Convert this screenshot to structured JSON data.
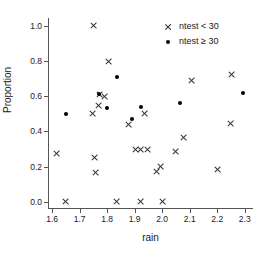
{
  "chart_data": {
    "type": "scatter",
    "title": "",
    "xlabel": "rain",
    "ylabel": "Proportion",
    "xlim": [
      1.585,
      2.33
    ],
    "ylim": [
      -0.035,
      1.045
    ],
    "grid": false,
    "xticks": [
      1.6,
      1.7,
      1.8,
      1.9,
      2.0,
      2.1,
      2.2,
      2.3
    ],
    "xticklabels": [
      "1.6",
      "1.7",
      "1.8",
      "1.9",
      "2.0",
      "2.1",
      "2.2",
      "2.3"
    ],
    "yticks": [
      0.0,
      0.2,
      0.4,
      0.6,
      0.8,
      1.0
    ],
    "yticklabels": [
      "0.0",
      "0.2",
      "0.4",
      "0.6",
      "0.8",
      "1.0"
    ],
    "legend_position": "top-right",
    "series": [
      {
        "name": "ntest < 30",
        "marker": "cross",
        "color": "#333333",
        "points": [
          [
            1.615,
            0.277
          ],
          [
            1.65,
            0.0
          ],
          [
            1.745,
            0.5
          ],
          [
            1.75,
            1.0
          ],
          [
            1.755,
            0.25
          ],
          [
            1.757,
            0.168
          ],
          [
            1.768,
            0.545
          ],
          [
            1.772,
            0.61
          ],
          [
            1.79,
            0.6
          ],
          [
            1.805,
            0.8
          ],
          [
            1.835,
            0.0
          ],
          [
            1.878,
            0.44
          ],
          [
            1.903,
            0.295
          ],
          [
            1.92,
            0.0
          ],
          [
            1.922,
            0.295
          ],
          [
            1.935,
            0.5
          ],
          [
            1.948,
            0.295
          ],
          [
            1.978,
            0.17
          ],
          [
            1.995,
            0.2
          ],
          [
            2.0,
            0.0
          ],
          [
            2.05,
            0.288
          ],
          [
            2.078,
            0.365
          ],
          [
            2.105,
            0.69
          ],
          [
            2.2,
            0.182
          ],
          [
            2.248,
            0.443
          ],
          [
            2.252,
            0.722
          ]
        ]
      },
      {
        "name": "ntest ≥ 30",
        "marker": "dot",
        "color": "#000000",
        "points": [
          [
            1.65,
            0.5
          ],
          [
            1.77,
            0.615
          ],
          [
            1.8,
            0.532
          ],
          [
            1.835,
            0.708
          ],
          [
            1.89,
            0.47
          ],
          [
            1.923,
            0.537
          ],
          [
            2.063,
            0.56
          ],
          [
            2.293,
            0.618
          ]
        ]
      }
    ]
  },
  "legend": {
    "entries": [
      {
        "label": "ntest < 30",
        "marker": "cross"
      },
      {
        "label": "ntest ≥ 30",
        "marker": "dot"
      }
    ]
  }
}
